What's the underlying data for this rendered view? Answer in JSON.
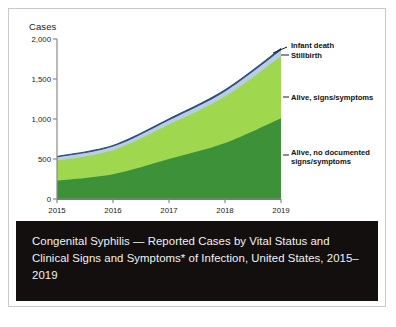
{
  "figure": {
    "caption": "Congenital Syphilis — Reported Cases by Vital Status and Clinical Signs and Symptoms* of Infection, United States, 2015–2019",
    "caption_bg": "#120f0e",
    "caption_color": "#f2f2f2",
    "border_color": "#c9c9c9"
  },
  "chart_data": {
    "type": "area",
    "title": "",
    "subtitle": "",
    "xlabel": "Year",
    "ylabel": "Cases",
    "x": [
      2015,
      2016,
      2017,
      2018,
      2019
    ],
    "categories": [
      "2015",
      "2016",
      "2017",
      "2018",
      "2019"
    ],
    "xtick_labels": [
      "2015",
      "2016",
      "2017",
      "2018",
      "2019"
    ],
    "ytick_labels": [
      "0",
      "500",
      "1,000",
      "1,500",
      "2,000"
    ],
    "ytick_values": [
      0,
      500,
      1000,
      1500,
      2000
    ],
    "ylim": [
      0,
      2000
    ],
    "xlim": [
      2015,
      2019
    ],
    "grid": false,
    "legend_position": "right-inline-annotations",
    "stacked": true,
    "series": [
      {
        "name": "Alive, no documented signs/symptoms",
        "color": "#3d9139",
        "values": [
          230,
          310,
          500,
          700,
          1010
        ]
      },
      {
        "name": "Alive, signs/symptoms",
        "color": "#9fd74e",
        "values": [
          250,
          300,
          430,
          580,
          775
        ]
      },
      {
        "name": "Stillbirth",
        "color": "#b8cde0",
        "values": [
          40,
          45,
          55,
          65,
          75
        ]
      },
      {
        "name": "Infant death",
        "color": "#2b4b7e",
        "values": [
          12,
          14,
          16,
          18,
          20
        ]
      }
    ],
    "annotations": [
      {
        "name": "infant-death",
        "text": "Infant death"
      },
      {
        "name": "stillbirth",
        "text": "Stillbirth"
      },
      {
        "name": "alive-signs-symptoms",
        "text": "Alive, signs/symptoms"
      },
      {
        "name": "alive-no-documented-line1",
        "text": "Alive, no documented"
      },
      {
        "name": "alive-no-documented-line2",
        "text": "signs/symptoms"
      }
    ],
    "axis_color": "#808080"
  }
}
